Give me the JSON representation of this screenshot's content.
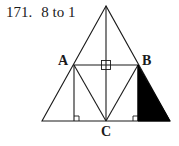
{
  "problem": {
    "number": "171.",
    "answer": "8 to 1"
  },
  "diagram": {
    "points": {
      "A": "A",
      "B": "B",
      "C": "C"
    },
    "colors": {
      "stroke": "#1a1a1a",
      "fill_shaded": "#000000",
      "background": "#ffffff"
    }
  }
}
